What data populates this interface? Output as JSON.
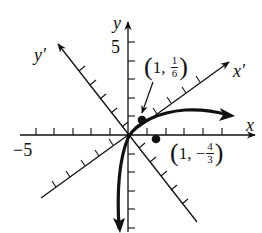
{
  "diagram": {
    "type": "rotated-axes-graph",
    "axes": {
      "x_label": "x",
      "y_label": "y",
      "x_prime_label": "x′",
      "y_prime_label": "y′",
      "x_tick_label": "−5",
      "y_tick_label": "5",
      "x_ticks_count_each_side": 5,
      "y_ticks_count_each_side": 5
    },
    "points": [
      {
        "name": "point-a",
        "x": "1",
        "sep": ",",
        "frac_sign": "",
        "frac_num": "1",
        "frac_den": "6",
        "pixel": [
          142,
          120
        ]
      },
      {
        "name": "point-b",
        "x": "1",
        "sep": ",",
        "frac_sign": "−",
        "frac_num": "4",
        "frac_den": "3",
        "pixel": [
          156,
          139
        ]
      }
    ],
    "colors": {
      "ink": "#111111",
      "background": "#ffffff"
    }
  }
}
